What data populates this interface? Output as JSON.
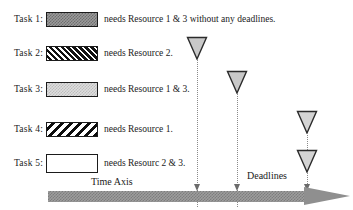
{
  "figure": {
    "background": "#ffffff"
  },
  "tasks": [
    {
      "label": "Task 1:",
      "pattern": "checker-dark-gray",
      "description": "needs Resource 1 & 3 without any deadlines."
    },
    {
      "label": "Task 2:",
      "pattern": "diagonal-hatch-white-on-black",
      "description": "needs Resource 2."
    },
    {
      "label": "Task 3:",
      "pattern": "checker-light-gray",
      "description": "needs Resource 1 & 3."
    },
    {
      "label": "Task 4:",
      "pattern": "diagonal-hatch-black-on-white",
      "description": "needs Resource 1."
    },
    {
      "label": "Task 5:",
      "pattern": "plain-white",
      "description": "needs Resourc 2 & 3."
    }
  ],
  "axis": {
    "time_axis_label": "Time Axis",
    "deadlines_label": "Deadlines",
    "arrow_color": "#8f8f8f",
    "direction": "right"
  },
  "deadlines": [
    {
      "id": "deadline-task-2",
      "marker": "down-triangle",
      "fill": "#c9c9c9",
      "stroke": "#2b2b2b"
    },
    {
      "id": "deadline-task-3",
      "marker": "down-triangle",
      "fill": "#c9c9c9",
      "stroke": "#2b2b2b"
    },
    {
      "id": "deadline-task-4",
      "marker": "down-triangle",
      "fill": "#d4d4d4",
      "stroke": "#2b2b2b"
    },
    {
      "id": "deadline-task-5",
      "marker": "down-triangle",
      "fill": "#d4d4d4",
      "stroke": "#2b2b2b"
    }
  ]
}
